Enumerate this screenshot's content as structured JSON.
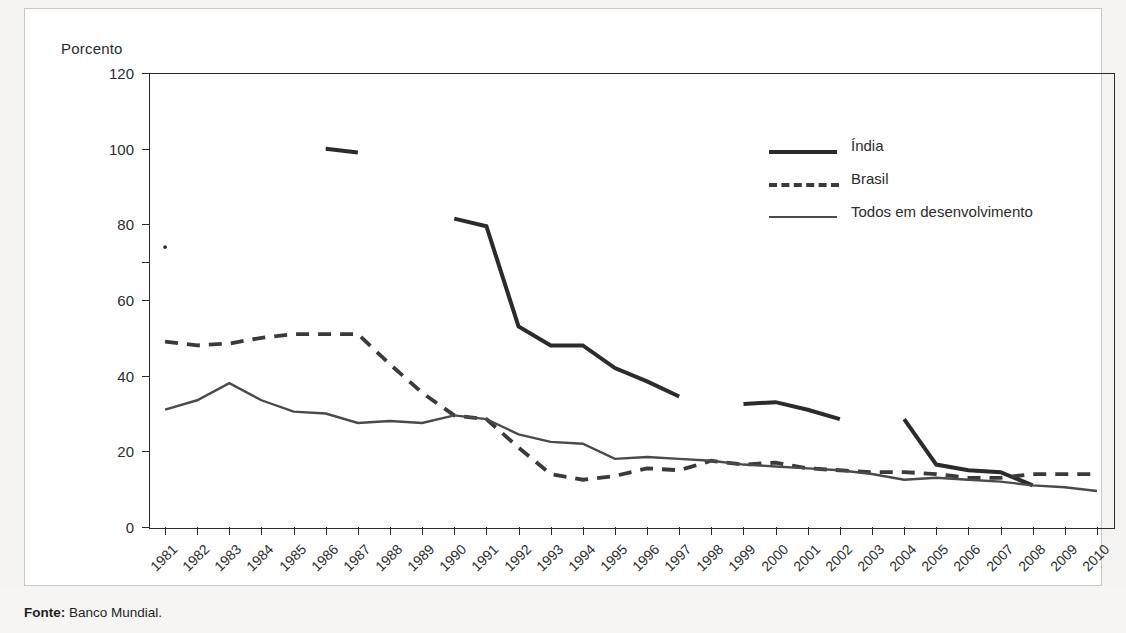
{
  "figure": {
    "unit_label": "Porcento",
    "source_label": "Fonte:",
    "source_value": " Banco Mundial."
  },
  "legend": {
    "position": "inside-top-right",
    "items": [
      {
        "label": "Índia",
        "style": "thick-solid",
        "color": "#2b2b2b"
      },
      {
        "label": "Brasil",
        "style": "dashed",
        "color": "#3a3a3a"
      },
      {
        "label": "Todos em desenvolvimento",
        "style": "thin-solid",
        "color": "#4a4a4a"
      }
    ]
  },
  "chart_data": {
    "type": "line",
    "title": "",
    "subtitle": "",
    "xlabel": "",
    "ylabel": "Porcento",
    "ylim": [
      0,
      120
    ],
    "yticks": [
      0,
      20,
      40,
      60,
      80,
      100,
      120
    ],
    "grid": false,
    "legend_position": "inside-top-right",
    "x": [
      1981,
      1982,
      1983,
      1984,
      1985,
      1986,
      1987,
      1988,
      1989,
      1990,
      1991,
      1992,
      1993,
      1994,
      1995,
      1996,
      1997,
      1998,
      1999,
      2000,
      2001,
      2002,
      2003,
      2004,
      2005,
      2006,
      2007,
      2008,
      2009,
      2010
    ],
    "xtick_labels": [
      "1981",
      "1982",
      "1983",
      "1984",
      "1985",
      "1986",
      "1987",
      "1988",
      "1989",
      "1990",
      "1991",
      "1992",
      "1993",
      "1994",
      "1995",
      "1996",
      "1997",
      "1998",
      "1999",
      "2000",
      "2001",
      "2002",
      "2003",
      "2004",
      "2005",
      "2006",
      "2007",
      "2008",
      "2009",
      "2010"
    ],
    "series": [
      {
        "name": "Índia",
        "style": "thick-solid",
        "color": "#2b2b2b",
        "note": "gapped series; isolated point in 1981",
        "values": [
          74,
          null,
          null,
          null,
          null,
          100,
          99,
          null,
          null,
          81.5,
          79.5,
          53,
          48,
          48,
          42,
          38.5,
          34.5,
          null,
          32.5,
          33,
          31,
          28.5,
          null,
          28.5,
          16.5,
          15,
          14.5,
          11,
          null,
          null
        ]
      },
      {
        "name": "Brasil",
        "style": "dashed",
        "color": "#3a3a3a",
        "values": [
          49,
          48,
          48.5,
          50,
          51,
          51,
          51,
          43,
          35.5,
          29.5,
          28.5,
          21,
          14,
          12.5,
          13.5,
          15.5,
          15,
          17.5,
          16.5,
          17,
          15.5,
          15,
          14.5,
          14.5,
          14,
          13,
          13,
          14,
          14,
          14
        ]
      },
      {
        "name": "Todos em desenvolvimento",
        "style": "thin-solid",
        "color": "#4a4a4a",
        "values": [
          31,
          33.5,
          38,
          33.5,
          30.5,
          30,
          27.5,
          28,
          27.5,
          29.5,
          28.5,
          24.5,
          22.5,
          22,
          18,
          18.5,
          18,
          17.5,
          16.5,
          16,
          15.5,
          15,
          14,
          12.5,
          13,
          12.5,
          12,
          11,
          10.5,
          9.5
        ]
      }
    ]
  }
}
